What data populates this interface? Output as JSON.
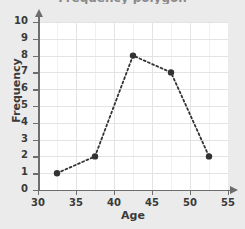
{
  "chart_data": {
    "type": "line",
    "title": "Frequency polygon",
    "xlabel": "Age",
    "ylabel": "Frequency",
    "x": [
      32.5,
      37.5,
      42.5,
      47.5,
      52.5
    ],
    "values": [
      1,
      2,
      8,
      7,
      2
    ],
    "series": [
      {
        "name": "Frequency",
        "x": [
          32.5,
          37.5,
          42.5,
          47.5,
          52.5
        ],
        "values": [
          1,
          2,
          8,
          7,
          2
        ]
      }
    ],
    "xlim": [
      30,
      55
    ],
    "ylim": [
      0,
      10
    ],
    "xticks": [
      30,
      35,
      40,
      45,
      50,
      55
    ],
    "yticks": [
      0,
      1,
      2,
      3,
      4,
      5,
      6,
      7,
      8,
      9,
      10
    ],
    "xtick_labels": [
      "30",
      "35",
      "40",
      "45",
      "50",
      "55"
    ],
    "ytick_labels": [
      "0",
      "1",
      "2",
      "3",
      "4",
      "5",
      "6",
      "7",
      "8",
      "9",
      "10"
    ],
    "x_minor_step": 2.5,
    "grid": true,
    "legend": null,
    "line_style": "dotted",
    "marker": "circle",
    "axis_arrows": true,
    "colors": {
      "line": "#333333",
      "marker": "#333333",
      "axis": "#6d6d6d",
      "grid_major": "#e3e3e3",
      "grid_minor": "#f0f0f0",
      "plot_background": "#ffffff",
      "page_background": "#ebebeb",
      "text": "#3a3a3a"
    }
  }
}
